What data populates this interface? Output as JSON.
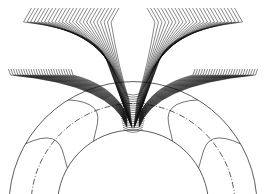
{
  "figure": {
    "colors": {
      "line": "#222222",
      "background": "#ffffff"
    },
    "center": [
      133,
      205.6
    ],
    "circles": {
      "outer_radius": 124,
      "pitch_radius": 102,
      "root_radius": 75.6
    },
    "envelope_lines": 26
  }
}
